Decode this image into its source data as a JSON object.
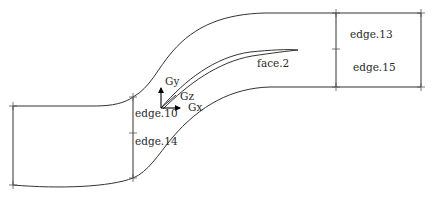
{
  "diagram": {
    "type": "2D geometry mesh sketch (S-shaped channel with blade)",
    "colors": {
      "line": "#333333",
      "background": "#ffffff",
      "axis": "#000000"
    },
    "axes": {
      "x_label": "Gx",
      "y_label": "Gy",
      "z_label": "Gz"
    },
    "labels": {
      "face": "face.2",
      "edge_10": "edge.10",
      "edge_14": "edge.14",
      "edge_13": "edge.13",
      "edge_15": "edge.15"
    }
  }
}
